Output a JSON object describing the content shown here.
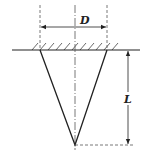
{
  "diagram": {
    "type": "cone-penetration-dimension-sketch",
    "labels": {
      "diameter": "D",
      "length": "L"
    },
    "colors": {
      "stroke": "#222222",
      "dashed": "#555555",
      "background": "#ffffff"
    }
  }
}
